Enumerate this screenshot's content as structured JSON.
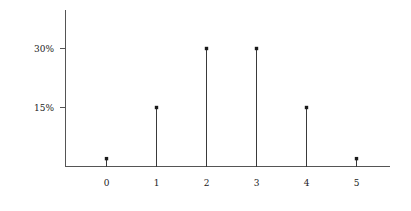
{
  "chart_data": {
    "type": "bar",
    "title": "",
    "subtitle": "",
    "xlabel": "",
    "ylabel": "",
    "categories": [
      "0",
      "1",
      "2",
      "3",
      "4",
      "5"
    ],
    "values": [
      2,
      15,
      30,
      30,
      15,
      2
    ],
    "value_labels": [
      "2%",
      "15%",
      "30%",
      "30%",
      "15%",
      "2%"
    ],
    "x": [
      0,
      1,
      2,
      3,
      4,
      5
    ],
    "xlim": [
      -0.8,
      6.5
    ],
    "ylim": [
      0,
      39
    ],
    "grid": false,
    "legend": null,
    "legend_position": "none",
    "marker": "square",
    "style": "stem",
    "y_ticks": [
      {
        "value": 30,
        "label": "30%"
      },
      {
        "value": 15,
        "label": "15%"
      }
    ],
    "x_ticks": [
      {
        "value": 0,
        "label": "0"
      },
      {
        "value": 1,
        "label": "1"
      },
      {
        "value": 2,
        "label": "2"
      },
      {
        "value": 3,
        "label": "3"
      },
      {
        "value": 4,
        "label": "4"
      },
      {
        "value": 5,
        "label": "5"
      }
    ],
    "colors": {
      "axis": "#555555",
      "stem": "#3a3a3a",
      "marker": "#1a1a1a",
      "background": "#ffffff",
      "text": "#222222"
    },
    "annotations": []
  },
  "axes": {
    "y_tick_0_label": "30%",
    "y_tick_1_label": "15%",
    "x_tick_0_label": "0",
    "x_tick_1_label": "1",
    "x_tick_2_label": "2",
    "x_tick_3_label": "3",
    "x_tick_4_label": "4",
    "x_tick_5_label": "5"
  }
}
